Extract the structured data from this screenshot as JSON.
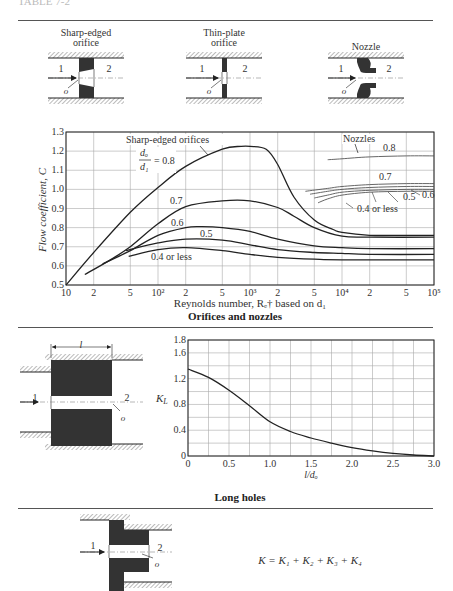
{
  "header": {
    "clipped_text": "TABLE 7-2"
  },
  "diagrams": {
    "sharp_edged": {
      "title_line1": "Sharp-edged",
      "title_line2": "orifice",
      "label_in": "1",
      "label_out": "2",
      "label_o": "o"
    },
    "thin_plate": {
      "title_line1": "Thin-plate",
      "title_line2": "orifice",
      "label_in": "1",
      "label_out": "2",
      "label_o": "o"
    },
    "nozzle": {
      "title_line1": "Nozzle",
      "label_in": "1",
      "label_out": "2",
      "label_o": "o"
    },
    "long_hole": {
      "label_len": "l",
      "label_in": "1",
      "label_out": "2",
      "label_o": "o"
    },
    "stepped": {
      "label_in": "1",
      "label_out": "2",
      "label_o": "o",
      "formula": "K = K₁ + K₂ + K₃ + K₄"
    }
  },
  "captions": {
    "orifices": "Orifices and nozzles",
    "long_holes": "Long holes"
  },
  "colors": {
    "ink": "#222222",
    "grid": "#999999",
    "hatch": "#777777",
    "solid": "#333333"
  },
  "chart_data": [
    {
      "type": "line",
      "title": "Orifices and nozzles",
      "xlabel": "Reynolds number, Rₑ† based on d₁",
      "ylabel": "Flow coefficient, C",
      "xscale": "log",
      "xlim": [
        10,
        100000
      ],
      "ylim": [
        0.5,
        1.3
      ],
      "grid": true,
      "xticks": [
        {
          "v": 10,
          "label": "10"
        },
        {
          "v": 20,
          "label": "2"
        },
        {
          "v": 50,
          "label": "5"
        },
        {
          "v": 100,
          "label": "10²"
        },
        {
          "v": 200,
          "label": "2"
        },
        {
          "v": 500,
          "label": "5"
        },
        {
          "v": 1000,
          "label": "10³"
        },
        {
          "v": 2000,
          "label": "2"
        },
        {
          "v": 5000,
          "label": "5"
        },
        {
          "v": 10000,
          "label": "10⁴"
        },
        {
          "v": 20000,
          "label": "2"
        },
        {
          "v": 50000,
          "label": "5"
        },
        {
          "v": 100000,
          "label": "10⁵"
        }
      ],
      "yticks": [
        0.5,
        0.6,
        0.7,
        0.8,
        0.9,
        1.0,
        1.1,
        1.2,
        1.3
      ],
      "ytick_labels": [
        "0.5",
        "0.6",
        "0.7",
        "0.8",
        "0.9",
        "1.0",
        "1.1",
        "1.2",
        "1.3"
      ],
      "annotations": {
        "sharp_title": "Sharp-edged orifices",
        "ratio_num": "dₒ",
        "ratio_den": "d₁",
        "ratio_eq": "= 0.8",
        "nozzles": "Nozzles"
      },
      "series": [
        {
          "name": "Sharp-edged 0.8",
          "group": "orifice",
          "label": "",
          "x": [
            10,
            20,
            50,
            100,
            200,
            500,
            800,
            1000,
            1500,
            2000,
            3000,
            5000,
            8000,
            10000,
            20000,
            50000,
            100000
          ],
          "y": [
            0.5,
            0.67,
            0.88,
            1.01,
            1.12,
            1.21,
            1.225,
            1.225,
            1.21,
            1.13,
            0.96,
            0.84,
            0.79,
            0.775,
            0.76,
            0.76,
            0.76
          ]
        },
        {
          "name": "Sharp-edged 0.7",
          "group": "orifice",
          "label": "0.7",
          "x": [
            16,
            30,
            50,
            100,
            200,
            500,
            1000,
            2000,
            3000,
            5000,
            10000,
            20000,
            100000
          ],
          "y": [
            0.555,
            0.63,
            0.7,
            0.82,
            0.91,
            0.94,
            0.94,
            0.905,
            0.86,
            0.8,
            0.755,
            0.75,
            0.75
          ]
        },
        {
          "name": "Sharp-edged 0.6",
          "group": "orifice",
          "label": "0.6",
          "x": [
            25,
            50,
            100,
            200,
            300,
            500,
            1000,
            2000,
            5000,
            10000,
            20000,
            100000
          ],
          "y": [
            0.61,
            0.68,
            0.76,
            0.8,
            0.805,
            0.8,
            0.78,
            0.74,
            0.705,
            0.695,
            0.69,
            0.69
          ]
        },
        {
          "name": "Sharp-edged 0.5",
          "group": "orifice",
          "label": "0.5",
          "x": [
            45,
            100,
            200,
            500,
            1000,
            2000,
            5000,
            10000,
            20000,
            100000
          ],
          "y": [
            0.68,
            0.72,
            0.74,
            0.735,
            0.71,
            0.685,
            0.67,
            0.665,
            0.66,
            0.66
          ]
        },
        {
          "name": "Sharp-edged 0.4 or less",
          "group": "orifice",
          "label": "0.4 or less",
          "x": [
            48,
            100,
            200,
            500,
            1000,
            2000,
            5000,
            10000,
            100000
          ],
          "y": [
            0.65,
            0.685,
            0.695,
            0.68,
            0.66,
            0.645,
            0.635,
            0.632,
            0.632
          ]
        },
        {
          "name": "Nozzle 0.8",
          "group": "nozzle",
          "label": "0.8",
          "x": [
            7000,
            10000,
            20000,
            50000,
            100000
          ],
          "y": [
            1.155,
            1.16,
            1.17,
            1.175,
            1.175
          ]
        },
        {
          "name": "Nozzle 0.7",
          "group": "nozzle",
          "label": "0.7",
          "x": [
            4000,
            7000,
            10000,
            20000,
            50000,
            100000
          ],
          "y": [
            0.99,
            1.005,
            1.015,
            1.025,
            1.03,
            1.03
          ]
        },
        {
          "name": "Nozzle 0.6",
          "group": "nozzle",
          "label": "0.6",
          "x": [
            4500,
            7000,
            10000,
            20000,
            50000,
            100000
          ],
          "y": [
            0.975,
            0.99,
            1.0,
            1.01,
            1.015,
            1.015
          ]
        },
        {
          "name": "Nozzle 0.5",
          "group": "nozzle",
          "label": "0.5",
          "x": [
            5000,
            7000,
            10000,
            20000,
            50000,
            100000
          ],
          "y": [
            0.955,
            0.97,
            0.985,
            0.995,
            1.0,
            1.0
          ]
        },
        {
          "name": "Nozzle 0.4 or less",
          "group": "nozzle",
          "label": "0.4 or less",
          "x": [
            5500,
            7000,
            10000,
            20000,
            50000,
            100000
          ],
          "y": [
            0.93,
            0.95,
            0.97,
            0.985,
            0.99,
            0.99
          ]
        }
      ]
    },
    {
      "type": "line",
      "title": "Long holes",
      "xlabel": "l/dₒ",
      "ylabel": "K_L",
      "xlim": [
        0,
        3.0
      ],
      "ylim": [
        0,
        1.8
      ],
      "grid": true,
      "xticks": [
        0,
        0.25,
        0.5,
        0.75,
        1.0,
        1.25,
        1.5,
        1.75,
        2.0,
        2.25,
        2.5,
        2.75,
        3.0
      ],
      "xtick_labels": [
        {
          "v": 0,
          "label": "0"
        },
        {
          "v": 0.5,
          "label": "0.5"
        },
        {
          "v": 1.0,
          "label": "1.0"
        },
        {
          "v": 1.5,
          "label": "1.5"
        },
        {
          "v": 2.0,
          "label": "2.0"
        },
        {
          "v": 2.5,
          "label": "2.5"
        },
        {
          "v": 3.0,
          "label": "3.0"
        }
      ],
      "yticks": [
        0,
        0.2,
        0.4,
        0.6,
        0.8,
        1.0,
        1.2,
        1.4,
        1.6,
        1.8
      ],
      "ytick_labels": [
        {
          "v": 0,
          "label": "0"
        },
        {
          "v": 0.4,
          "label": "0.4"
        },
        {
          "v": 0.8,
          "label": "0.8"
        },
        {
          "v": 1.2,
          "label": "1.2"
        },
        {
          "v": 1.6,
          "label": "1.6"
        },
        {
          "v": 1.8,
          "label": "1.8"
        }
      ],
      "series": [
        {
          "name": "K_L",
          "x": [
            0,
            0.25,
            0.5,
            0.75,
            1.0,
            1.25,
            1.5,
            1.75,
            2.0,
            2.25,
            2.5,
            2.75,
            3.0
          ],
          "y": [
            1.35,
            1.22,
            1.02,
            0.78,
            0.53,
            0.38,
            0.28,
            0.2,
            0.13,
            0.08,
            0.04,
            0.015,
            0.0
          ]
        }
      ]
    }
  ]
}
